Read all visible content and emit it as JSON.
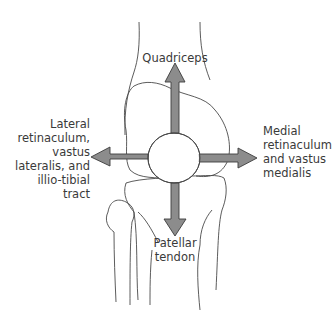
{
  "diagram": {
    "labels": {
      "top": "Quadriceps",
      "left": [
        "Lateral",
        "retinaculum,",
        "vastus",
        "lateralis, and",
        "illio-tibial tract"
      ],
      "right": [
        "Medial",
        "retinaculum",
        "and vastus",
        "medialis"
      ],
      "bottom": [
        "Patellar",
        "tendon"
      ]
    },
    "colors": {
      "arrow_fill": "#8c8c8c",
      "arrow_stroke": "#3c3c3c",
      "line": "#4a4a4a",
      "text": "#3a3a3a"
    }
  }
}
